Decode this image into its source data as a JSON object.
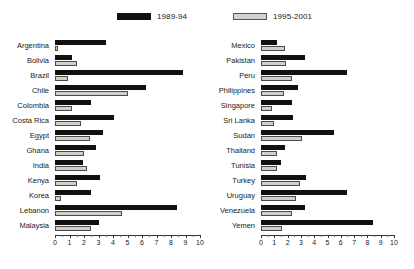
{
  "legend": {
    "series": [
      {
        "name": "1989-94",
        "color": "#111111",
        "swatch": "dark"
      },
      {
        "name": "1995-2001",
        "color": "#cfcfcf",
        "swatch": "light"
      }
    ]
  },
  "chart_data": {
    "type": "bar",
    "orientation": "horizontal",
    "title": "",
    "xlabel": "",
    "ylabel": "",
    "xlim": [
      0,
      10
    ],
    "xticks": [
      0,
      1,
      2,
      3,
      4,
      5,
      6,
      7,
      8,
      9,
      10
    ],
    "grid": false,
    "legend_position": "top",
    "panels": [
      {
        "id": "left",
        "categories": [
          "Argentina",
          "Bolivia",
          "Brazil",
          "Chile",
          "Colombia",
          "Costa Rica",
          "Egypt",
          "Ghana",
          "India",
          "Kenya",
          "Korea",
          "Lebanon",
          "Malaysia"
        ],
        "series": [
          {
            "name": "1989-94",
            "values": [
              3.5,
              1.2,
              8.8,
              6.3,
              2.5,
              4.1,
              3.3,
              2.8,
              1.9,
              3.1,
              2.5,
              8.4,
              3.0
            ]
          },
          {
            "name": "1995-2001",
            "values": [
              0.2,
              1.5,
              0.9,
              5.0,
              1.2,
              1.8,
              2.4,
              2.0,
              2.2,
              1.5,
              0.4,
              4.6,
              2.5
            ]
          }
        ]
      },
      {
        "id": "right",
        "categories": [
          "Mexico",
          "Pakistan",
          "Peru",
          "Philippines",
          "Singapore",
          "Sri Lanka",
          "Sudan",
          "Thailand",
          "Tunisia",
          "Turkey",
          "Uruguay",
          "Venezuela",
          "Yemen"
        ],
        "series": [
          {
            "name": "1989-94",
            "values": [
              1.2,
              3.3,
              6.5,
              2.8,
              2.3,
              2.4,
              5.5,
              1.8,
              1.5,
              3.4,
              6.5,
              3.3,
              8.4
            ]
          },
          {
            "name": "1995-2001",
            "values": [
              1.8,
              1.9,
              2.3,
              1.7,
              0.8,
              1.0,
              3.1,
              1.2,
              1.2,
              2.9,
              2.6,
              2.3,
              1.6
            ]
          }
        ]
      }
    ]
  }
}
